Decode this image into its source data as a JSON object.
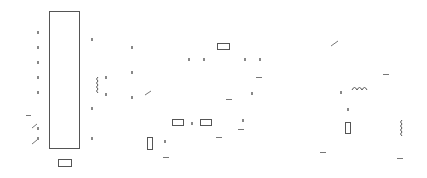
{
  "diagram": {
    "type": "circuit-schematic",
    "stroke_color": "#555555",
    "faint_color": "#888888",
    "background": "#ffffff",
    "components": {
      "ic_block": {
        "x": 49,
        "y": 11,
        "w": 30,
        "h": 137
      },
      "rect_small_bottom": {
        "x": 58,
        "y": 159,
        "w": 13,
        "h": 7
      },
      "resistor_top": {
        "x": 217,
        "y": 43,
        "w": 12,
        "h": 6
      },
      "resistor_mid_a": {
        "x": 172,
        "y": 119,
        "w": 11,
        "h": 6
      },
      "resistor_mid_b": {
        "x": 200,
        "y": 119,
        "w": 11,
        "h": 6
      },
      "resistor_v_left": {
        "x": 147,
        "y": 137,
        "w": 5,
        "h": 12
      },
      "resistor_v_right": {
        "x": 345,
        "y": 122,
        "w": 5,
        "h": 11
      },
      "inductor_left": {
        "x": 95,
        "y": 77,
        "orientation": "vertical"
      },
      "inductor_right_h": {
        "x": 352,
        "y": 90,
        "orientation": "horizontal"
      },
      "inductor_right_v": {
        "x": 399,
        "y": 120,
        "orientation": "vertical"
      }
    },
    "pin_ticks": [
      [
        37,
        31
      ],
      [
        37,
        46
      ],
      [
        37,
        61
      ],
      [
        37,
        76
      ],
      [
        37,
        91
      ],
      [
        37,
        127
      ],
      [
        37,
        137
      ],
      [
        91,
        38
      ],
      [
        91,
        137
      ],
      [
        91,
        107
      ],
      [
        105,
        76
      ],
      [
        105,
        93
      ],
      [
        131,
        46
      ],
      [
        131,
        71
      ],
      [
        131,
        96
      ],
      [
        188,
        58
      ],
      [
        203,
        58
      ],
      [
        244,
        58
      ],
      [
        259,
        58
      ],
      [
        251,
        92
      ],
      [
        242,
        119
      ],
      [
        164,
        140
      ],
      [
        191,
        122
      ],
      [
        340,
        91
      ],
      [
        347,
        108
      ]
    ],
    "dashes": [
      [
        26,
        115,
        5
      ],
      [
        256,
        77,
        6
      ],
      [
        226,
        99,
        6
      ],
      [
        238,
        129,
        6
      ],
      [
        216,
        137,
        6
      ],
      [
        163,
        157,
        6
      ],
      [
        383,
        74,
        6
      ],
      [
        320,
        152,
        6
      ],
      [
        397,
        158,
        6
      ]
    ],
    "slashes": [
      [
        32,
        128,
        37,
        124
      ],
      [
        32,
        144,
        37,
        140
      ],
      [
        145,
        95,
        151,
        91
      ],
      [
        331,
        46,
        338,
        41
      ]
    ]
  }
}
